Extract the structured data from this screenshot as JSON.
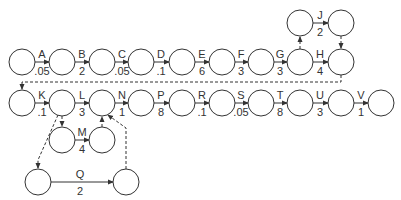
{
  "diagram": {
    "type": "activity-on-arrow network",
    "nodes": [
      {
        "id": "n1",
        "x": 22,
        "y": 62
      },
      {
        "id": "n2",
        "x": 62,
        "y": 62
      },
      {
        "id": "n3",
        "x": 102,
        "y": 62
      },
      {
        "id": "n4",
        "x": 141,
        "y": 62
      },
      {
        "id": "n5",
        "x": 182,
        "y": 62
      },
      {
        "id": "n6",
        "x": 222,
        "y": 62
      },
      {
        "id": "n7",
        "x": 261,
        "y": 62
      },
      {
        "id": "n8",
        "x": 300,
        "y": 62
      },
      {
        "id": "n9",
        "x": 341,
        "y": 62
      },
      {
        "id": "j1",
        "x": 300,
        "y": 23
      },
      {
        "id": "j2",
        "x": 341,
        "y": 23
      },
      {
        "id": "k1",
        "x": 22,
        "y": 103
      },
      {
        "id": "k2",
        "x": 62,
        "y": 103
      },
      {
        "id": "k3",
        "x": 102,
        "y": 103
      },
      {
        "id": "k4",
        "x": 141,
        "y": 103
      },
      {
        "id": "k5",
        "x": 182,
        "y": 103
      },
      {
        "id": "k6",
        "x": 222,
        "y": 103
      },
      {
        "id": "k7",
        "x": 261,
        "y": 103
      },
      {
        "id": "k8",
        "x": 300,
        "y": 103
      },
      {
        "id": "k9",
        "x": 341,
        "y": 103
      },
      {
        "id": "k10",
        "x": 381,
        "y": 103
      },
      {
        "id": "m1",
        "x": 62,
        "y": 140
      },
      {
        "id": "m2",
        "x": 102,
        "y": 140
      },
      {
        "id": "q1",
        "x": 38,
        "y": 182
      },
      {
        "id": "q2",
        "x": 126,
        "y": 182
      }
    ],
    "activities": [
      {
        "name": "A",
        "duration": ".05",
        "from": "n1",
        "to": "n2"
      },
      {
        "name": "B",
        "duration": "2",
        "from": "n2",
        "to": "n3"
      },
      {
        "name": "C",
        "duration": ".05",
        "from": "n3",
        "to": "n4"
      },
      {
        "name": "D",
        "duration": ".1",
        "from": "n4",
        "to": "n5"
      },
      {
        "name": "E",
        "duration": "6",
        "from": "n5",
        "to": "n6"
      },
      {
        "name": "F",
        "duration": "3",
        "from": "n6",
        "to": "n7"
      },
      {
        "name": "G",
        "duration": "3",
        "from": "n7",
        "to": "n8"
      },
      {
        "name": "H",
        "duration": "4",
        "from": "n8",
        "to": "n9"
      },
      {
        "name": "J",
        "duration": "2",
        "from": "j1",
        "to": "j2"
      },
      {
        "name": "K",
        "duration": ".1",
        "from": "k1",
        "to": "k2"
      },
      {
        "name": "L",
        "duration": "3",
        "from": "k2",
        "to": "k3"
      },
      {
        "name": "N",
        "duration": "1",
        "from": "k3",
        "to": "k4"
      },
      {
        "name": "P",
        "duration": "8",
        "from": "k4",
        "to": "k5"
      },
      {
        "name": "R",
        "duration": ".1",
        "from": "k5",
        "to": "k6"
      },
      {
        "name": "S",
        "duration": ".05",
        "from": "k6",
        "to": "k7"
      },
      {
        "name": "T",
        "duration": "8",
        "from": "k7",
        "to": "k8"
      },
      {
        "name": "U",
        "duration": "3",
        "from": "k8",
        "to": "k9"
      },
      {
        "name": "V",
        "duration": "1",
        "from": "k9",
        "to": "k10"
      },
      {
        "name": "M",
        "duration": "4",
        "from": "m1",
        "to": "m2"
      },
      {
        "name": "Q",
        "duration": "2",
        "from": "q1",
        "to": "q2"
      }
    ],
    "dummies": [
      {
        "from": "n8",
        "to": "j1"
      },
      {
        "from": "j2",
        "to": "n9"
      },
      {
        "from": "n9",
        "to": "k1"
      },
      {
        "from": "k2",
        "to": "m1"
      },
      {
        "from": "m2",
        "to": "k3"
      },
      {
        "from": "k2",
        "to": "q1"
      },
      {
        "from": "q2",
        "to": "k3"
      }
    ]
  },
  "labels": {
    "A": {
      "name": "A",
      "dur": ".05"
    },
    "B": {
      "name": "B",
      "dur": "2"
    },
    "C": {
      "name": "C",
      "dur": ".05"
    },
    "D": {
      "name": "D",
      "dur": ".1"
    },
    "E": {
      "name": "E",
      "dur": "6"
    },
    "F": {
      "name": "F",
      "dur": "3"
    },
    "G": {
      "name": "G",
      "dur": "3"
    },
    "H": {
      "name": "H",
      "dur": "4"
    },
    "J": {
      "name": "J",
      "dur": "2"
    },
    "K": {
      "name": "K",
      "dur": ".1"
    },
    "L": {
      "name": "L",
      "dur": "3"
    },
    "N": {
      "name": "N",
      "dur": "1"
    },
    "P": {
      "name": "P",
      "dur": "8"
    },
    "R": {
      "name": "R",
      "dur": ".1"
    },
    "S": {
      "name": "S",
      "dur": ".05"
    },
    "T": {
      "name": "T",
      "dur": "8"
    },
    "U": {
      "name": "U",
      "dur": "3"
    },
    "V": {
      "name": "V",
      "dur": "1"
    },
    "M": {
      "name": "M",
      "dur": "4"
    },
    "Q": {
      "name": "Q",
      "dur": "2"
    }
  },
  "colors": {
    "stroke": "#333333",
    "background": "#ffffff"
  }
}
